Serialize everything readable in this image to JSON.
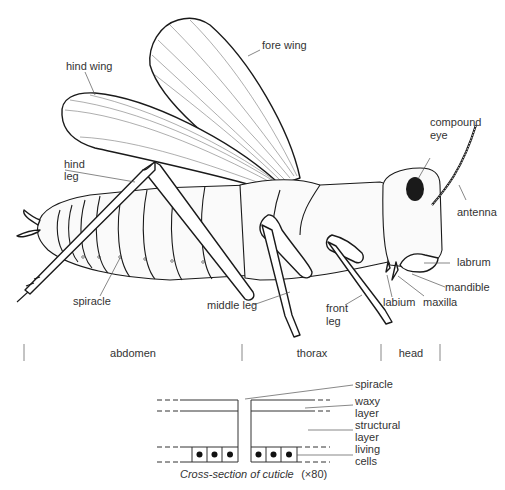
{
  "diagram": {
    "labels": {
      "fore_wing": "fore wing",
      "hind_wing": "hind wing",
      "hind_leg_1": "hind",
      "hind_leg_2": "leg",
      "compound_eye_1": "compound",
      "compound_eye_2": "eye",
      "antenna": "antenna",
      "labrum": "labrum",
      "mandible": "mandible",
      "maxilla": "maxilla",
      "labium": "labium",
      "front_leg_1": "front",
      "front_leg_2": "leg",
      "middle_leg": "middle leg",
      "spiracle": "spiracle"
    },
    "regions": [
      {
        "name": "abdomen"
      },
      {
        "name": "thorax"
      },
      {
        "name": "head"
      }
    ],
    "cuticle": {
      "labels": {
        "spiracle": "spiracle",
        "waxy_1": "waxy",
        "waxy_2": "layer",
        "structural_1": "structural",
        "structural_2": "layer",
        "living_1": "living",
        "living_2": "cells"
      },
      "caption_main": "Cross-section of cuticle",
      "caption_scale": "(×80)"
    }
  }
}
